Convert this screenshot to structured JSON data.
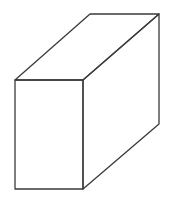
{
  "diagram": {
    "type": "3d-box-line-drawing",
    "stroke_color": "#3a3a3a",
    "background": "#ffffff",
    "vertices": {
      "front_top_left": [
        15,
        80
      ],
      "front_top_right": [
        83,
        80
      ],
      "front_bottom_left": [
        15,
        189
      ],
      "front_bottom_right": [
        83,
        189
      ],
      "back_top_left": [
        90,
        14
      ],
      "back_top_right": [
        159,
        14
      ],
      "back_bottom_right": [
        159,
        124
      ]
    }
  }
}
